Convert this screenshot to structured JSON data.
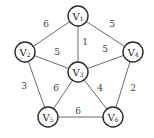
{
  "graph": {
    "type": "undirected-weighted",
    "colors": {
      "edge": "#6a6a6a",
      "node_stroke": "#2a2a2a",
      "node_fill": "#ffffff",
      "text": "#222222"
    },
    "nodes": [
      {
        "id": "V1",
        "letter": "V",
        "sub": "1",
        "x": 78,
        "y": 16
      },
      {
        "id": "V2",
        "letter": "V",
        "sub": "2",
        "x": 25,
        "y": 52
      },
      {
        "id": "V3",
        "letter": "V",
        "sub": "3",
        "x": 78,
        "y": 72
      },
      {
        "id": "V4",
        "letter": "V",
        "sub": "4",
        "x": 133,
        "y": 52
      },
      {
        "id": "V5",
        "letter": "V",
        "sub": "5",
        "x": 48,
        "y": 117
      },
      {
        "id": "V6",
        "letter": "V",
        "sub": "6",
        "x": 113,
        "y": 117
      }
    ],
    "edges": [
      {
        "from": "V1",
        "to": "V2",
        "weight": "6",
        "lx": 46,
        "ly": 24
      },
      {
        "from": "V1",
        "to": "V3",
        "weight": "1",
        "lx": 85,
        "ly": 42
      },
      {
        "from": "V1",
        "to": "V4",
        "weight": "5",
        "lx": 112,
        "ly": 24
      },
      {
        "from": "V2",
        "to": "V3",
        "weight": "5",
        "lx": 57,
        "ly": 52
      },
      {
        "from": "V3",
        "to": "V4",
        "weight": "5",
        "lx": 105,
        "ly": 49
      },
      {
        "from": "V2",
        "to": "V5",
        "weight": "3",
        "lx": 24,
        "ly": 86
      },
      {
        "from": "V3",
        "to": "V5",
        "weight": "6",
        "lx": 56,
        "ly": 88
      },
      {
        "from": "V3",
        "to": "V6",
        "weight": "4",
        "lx": 100,
        "ly": 88
      },
      {
        "from": "V4",
        "to": "V6",
        "weight": "2",
        "lx": 133,
        "ly": 88
      },
      {
        "from": "V5",
        "to": "V6",
        "weight": "6",
        "lx": 78,
        "ly": 111
      }
    ]
  }
}
